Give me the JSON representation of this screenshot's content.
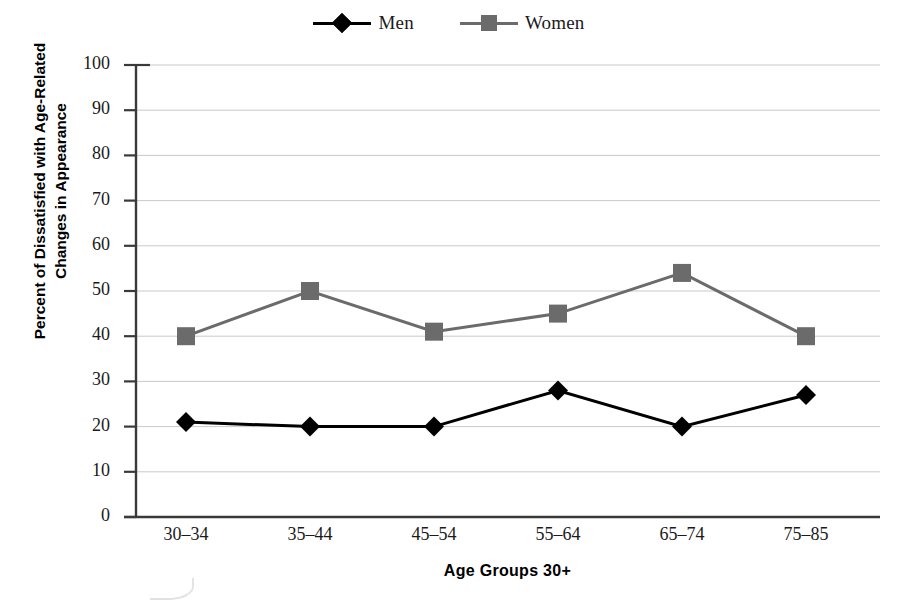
{
  "chart_data": {
    "type": "line",
    "title": "",
    "xlabel": "Age Groups 30+",
    "ylabel": "Percent of Dissatisfied with Age-Related Changes in Appearance",
    "categories": [
      "30–34",
      "35–44",
      "45–54",
      "55–64",
      "65–74",
      "75–85"
    ],
    "yticks": [
      "0",
      "10",
      "20",
      "30",
      "40",
      "50",
      "60",
      "70",
      "80",
      "90",
      "100"
    ],
    "ylim": [
      0,
      100
    ],
    "grid": true,
    "legend_position": "top-center",
    "series": [
      {
        "name": "Men",
        "values": [
          21,
          20,
          20,
          28,
          20,
          27
        ],
        "color": "#000000",
        "marker": "diamond"
      },
      {
        "name": "Women",
        "values": [
          40,
          50,
          41,
          45,
          54,
          40
        ],
        "color": "#6b6b6b",
        "marker": "square"
      }
    ]
  },
  "legend": {
    "entries": [
      {
        "label": "Men",
        "marker": "diamond-marker-icon"
      },
      {
        "label": "Women",
        "marker": "square-marker-icon"
      }
    ]
  },
  "axis": {
    "x_title": "Age Groups 30+",
    "y_title_line1": "Percent of Dissatisfied with Age-Related",
    "y_title_line2": "Changes in Appearance"
  },
  "colors": {
    "men_series": "#000000",
    "women_series": "#6b6b6b",
    "axis": "#3a3a3a",
    "grid": "#c9c9c9",
    "background": "#ffffff"
  }
}
